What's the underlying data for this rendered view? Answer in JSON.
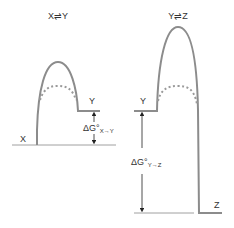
{
  "colors": {
    "curve": "#8c8c8c",
    "baseline": "#a0a0a0",
    "arrow": "#222222",
    "text": "#333333"
  },
  "left_panel": {
    "title": "X⇌Y",
    "start_label": "X",
    "end_label": "Y",
    "delta_label": "ΔG°",
    "delta_subscript": "X→Y"
  },
  "right_panel": {
    "title": "Y⇌Z",
    "start_label": "Y",
    "end_label": "Z",
    "delta_label": "ΔG°",
    "delta_subscript": "Y→Z"
  }
}
